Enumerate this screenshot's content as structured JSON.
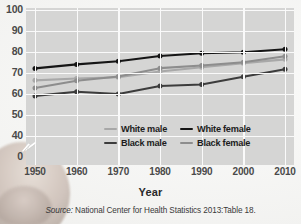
{
  "figure": {
    "axis_title": "Year",
    "source_prefix": "Source:",
    "source_text": "National Center for Health Statistics 2013:Table 18."
  },
  "legend": {
    "position": "inside-bottom-center",
    "entries": [
      {
        "label": "White male",
        "color": "#a8a8a8"
      },
      {
        "label": "White female",
        "color": "#151515"
      },
      {
        "label": "Black male",
        "color": "#3c3c3c"
      },
      {
        "label": "Black female",
        "color": "#8d8d8d"
      }
    ]
  },
  "axes": {
    "y_ticks": [
      "100",
      "90",
      "80",
      "70",
      "60",
      "50",
      "40",
      "0"
    ],
    "x_ticks": [
      "1950",
      "1960",
      "1970",
      "1980",
      "1990",
      "2000",
      "2010"
    ],
    "y_break_between": [
      "40",
      "0"
    ]
  },
  "style": {
    "plot_background": "#d5d5d4",
    "gridline_color": "#fafafa",
    "page_background": "#f2f2f1",
    "tick_label_color": "#4a4a4a"
  },
  "chart_data": {
    "type": "line",
    "title": "",
    "xlabel": "Year",
    "ylabel": "",
    "x": [
      1950,
      1960,
      1970,
      1980,
      1990,
      2000,
      2010
    ],
    "xlim": [
      1950,
      2010
    ],
    "ylim": [
      40,
      100
    ],
    "y_axis_break": true,
    "grid": true,
    "legend_position": "inside-bottom-center",
    "series": [
      {
        "name": "White female",
        "color": "#151515",
        "values": [
          72.2,
          74.1,
          75.6,
          78.1,
          79.4,
          79.9,
          81.3
        ]
      },
      {
        "name": "White male",
        "color": "#a8a8a8",
        "values": [
          66.5,
          67.4,
          68.0,
          70.7,
          72.7,
          74.7,
          76.5
        ]
      },
      {
        "name": "Black female",
        "color": "#8d8d8d",
        "values": [
          62.9,
          66.3,
          68.3,
          72.3,
          73.6,
          75.1,
          78.0
        ]
      },
      {
        "name": "Black male",
        "color": "#3c3c3c",
        "values": [
          59.1,
          61.1,
          60.0,
          63.8,
          64.5,
          68.2,
          71.8
        ]
      }
    ]
  }
}
